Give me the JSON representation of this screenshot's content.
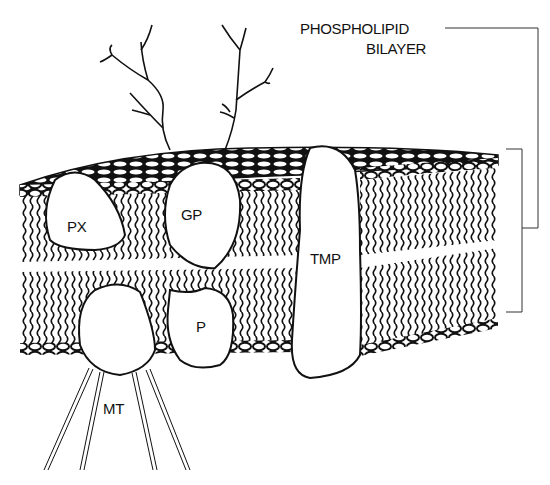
{
  "diagram": {
    "title_line1": "PHOSPHOLIPID",
    "title_line2": "BILAYER",
    "labels": {
      "px": "PX",
      "gp": "GP",
      "tmp": "TMP",
      "p": "P",
      "mt": "MT"
    },
    "colors": {
      "ink": "#111111",
      "background": "#ffffff"
    }
  }
}
